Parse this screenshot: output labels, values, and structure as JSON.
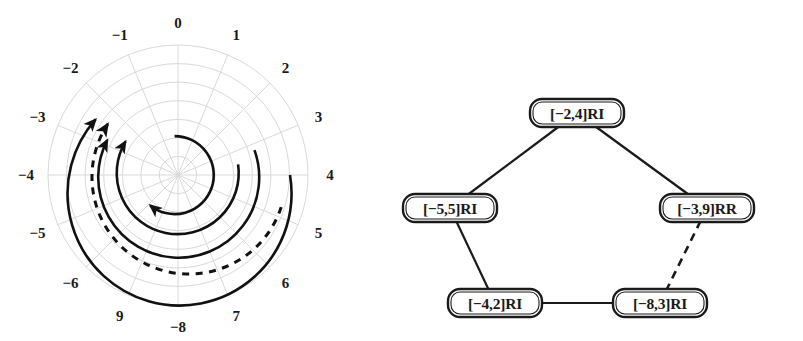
{
  "figure": {
    "panels": [
      "polar-spiral-plot",
      "state-transition-graph"
    ]
  },
  "chart_data": {
    "type": "line",
    "subtype": "polar-spiral",
    "title": "",
    "xlabel": "",
    "ylabel": "",
    "grid": true,
    "legend": null,
    "angular_axis": {
      "label": "",
      "tick_labels": [
        "0",
        "1",
        "2",
        "3",
        "4",
        "5",
        "6",
        "7",
        "-8",
        "9",
        "-6",
        "-5",
        "-4",
        "-3",
        "-2",
        "-1"
      ],
      "tick_angles_deg": [
        90,
        67.5,
        45,
        22.5,
        0,
        -22.5,
        -45,
        -67.5,
        -90,
        -112.5,
        -135,
        -157.5,
        180,
        157.5,
        135,
        112.5
      ],
      "n_spokes": 16
    },
    "radial_axis": {
      "label": "",
      "n_rings": 7,
      "rlim": [
        0,
        1
      ]
    },
    "series": [
      {
        "name": "arc-1-innermost",
        "style": "solid",
        "arrow": "end",
        "radius": 0.3,
        "start_angle_deg": 95,
        "end_angle_deg": -255,
        "direction": "clockwise"
      },
      {
        "name": "arc-2",
        "style": "solid",
        "arrow": "end",
        "radius": 0.47,
        "start_angle_deg": 10,
        "end_angle_deg": -205,
        "direction": "clockwise"
      },
      {
        "name": "arc-3",
        "style": "solid",
        "arrow": "end",
        "radius": 0.62,
        "start_angle_deg": 18,
        "end_angle_deg": -185,
        "direction": "clockwise"
      },
      {
        "name": "arc-4-outermost",
        "style": "solid",
        "arrow": "end",
        "radius": 0.86,
        "start_angle_deg": 0,
        "end_angle_deg": -222,
        "direction": "clockwise"
      },
      {
        "name": "arc-dashed",
        "style": "dashed",
        "arrow": "end",
        "radius": 0.745,
        "start_angle_deg": -88,
        "end_angle_deg": -230,
        "direction": "clockwise",
        "note": "dashed spiral sweeping from right through bottom to upper-left"
      }
    ]
  },
  "graph": {
    "type": "node-link-diagram",
    "nodes": [
      {
        "id": "n-top",
        "label": "[−2,4]RI",
        "x": 177,
        "y": 113
      },
      {
        "id": "n-left",
        "label": "[−5,5]RI",
        "x": 50,
        "y": 208
      },
      {
        "id": "n-right",
        "label": "[−3,9]RR",
        "x": 307,
        "y": 208
      },
      {
        "id": "n-bottom-left",
        "label": "[−4,2]RI",
        "x": 95,
        "y": 303
      },
      {
        "id": "n-bottom-right",
        "label": "[−8,3]RI",
        "x": 260,
        "y": 303
      }
    ],
    "edges": [
      {
        "id": "e-top-left",
        "from": "n-top",
        "to": "n-left",
        "style": "solid"
      },
      {
        "id": "e-top-right",
        "from": "n-top",
        "to": "n-right",
        "style": "solid"
      },
      {
        "id": "e-left-bl",
        "from": "n-left",
        "to": "n-bottom-left",
        "style": "solid"
      },
      {
        "id": "e-bl-br",
        "from": "n-bottom-left",
        "to": "n-bottom-right",
        "style": "solid"
      },
      {
        "id": "e-right-br",
        "from": "n-right",
        "to": "n-bottom-right",
        "style": "dashed"
      }
    ]
  }
}
